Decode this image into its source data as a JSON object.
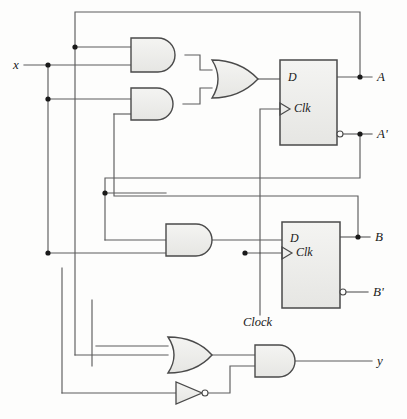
{
  "diagram": {
    "type": "logic-circuit-schematic",
    "colors": {
      "background": "#fdfdfc",
      "wire": "#5d5d5d",
      "gate_outline": "#4a4a4a",
      "gate_fill": "#eeeeec",
      "text": "#1a1a1a",
      "junction": "#1a1a1a"
    }
  },
  "labels": {
    "input_x": "x",
    "clock": "Clock",
    "output_A": "A",
    "output_A_not": "A'",
    "output_B": "B",
    "output_B_not": "B'",
    "output_y": "y"
  },
  "flipflops": [
    {
      "id": "ff-a",
      "d_label": "D",
      "clk_label": "Clk",
      "q_label": "A",
      "qnot_label": "A'",
      "x": 280,
      "y": 60,
      "w": 57,
      "h": 85
    },
    {
      "id": "ff-b",
      "d_label": "D",
      "clk_label": "Clk",
      "q_label": "B",
      "qnot_label": "B'",
      "x": 282,
      "y": 222,
      "w": 58,
      "h": 86
    }
  ],
  "gates": [
    {
      "id": "and-1",
      "type": "AND",
      "inputs": 2,
      "x": 131,
      "y": 38,
      "w": 54,
      "h": 34
    },
    {
      "id": "and-2",
      "type": "AND",
      "inputs": 2,
      "x": 131,
      "y": 88,
      "w": 52,
      "h": 32
    },
    {
      "id": "or-1",
      "type": "OR",
      "inputs": 2,
      "x": 212,
      "y": 60,
      "w": 46,
      "h": 38
    },
    {
      "id": "and-3",
      "type": "AND",
      "inputs": 2,
      "x": 166,
      "y": 224,
      "w": 46,
      "h": 32
    },
    {
      "id": "or-2",
      "type": "OR",
      "inputs": 2,
      "x": 168,
      "y": 337,
      "w": 44,
      "h": 36
    },
    {
      "id": "and-4",
      "type": "AND",
      "inputs": 2,
      "x": 255,
      "y": 345,
      "w": 40,
      "h": 32
    },
    {
      "id": "not-1",
      "type": "NOT",
      "inputs": 1,
      "x": 176,
      "y": 382,
      "w": 32,
      "h": 22
    }
  ],
  "nets": [
    {
      "name": "x-input",
      "from": "x",
      "to": [
        "and-1.in2",
        "and-2.in1",
        "or-2.in2",
        "and-3.in2"
      ]
    },
    {
      "name": "A-feedback",
      "from": "ff-a.Q",
      "to": [
        "and-1.in1"
      ]
    },
    {
      "name": "A-not-feedback",
      "from": "ff-a.Qnot",
      "to": [
        "and-3.in1"
      ]
    },
    {
      "name": "B-feedback",
      "from": "ff-b.Q",
      "to": [
        "and-2.in2",
        "and-4.in2"
      ]
    },
    {
      "name": "or1-to-D-A",
      "from": "or-1.out",
      "to": [
        "ff-a.D"
      ]
    },
    {
      "name": "and3-to-D-B",
      "from": "and-3.out",
      "to": [
        "ff-b.D"
      ]
    },
    {
      "name": "clock-net",
      "from": "Clock",
      "to": [
        "ff-a.Clk",
        "ff-b.Clk"
      ]
    },
    {
      "name": "or2-to-and4",
      "from": "or-2.out",
      "to": [
        "and-4.in1"
      ]
    },
    {
      "name": "not1-to-and4",
      "from": "not-1.out",
      "to": [
        "and-4.in2"
      ]
    },
    {
      "name": "and4-to-y",
      "from": "and-4.out",
      "to": [
        "y"
      ]
    }
  ],
  "junction_points": [
    {
      "x": 48,
      "y": 65
    },
    {
      "x": 48,
      "y": 99
    },
    {
      "x": 48,
      "y": 253
    },
    {
      "x": 75,
      "y": 47
    },
    {
      "x": 105,
      "y": 193
    },
    {
      "x": 245,
      "y": 253
    },
    {
      "x": 360,
      "y": 77
    },
    {
      "x": 360,
      "y": 134
    },
    {
      "x": 358,
      "y": 237
    }
  ]
}
